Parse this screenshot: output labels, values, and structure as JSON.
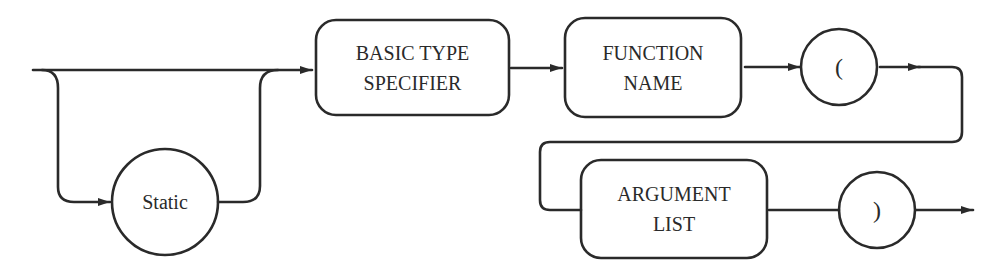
{
  "diagram": {
    "type": "syntax-diagram",
    "nodes": [
      {
        "id": "static",
        "shape": "circle",
        "label": "Static",
        "optional": true
      },
      {
        "id": "basic_type",
        "shape": "rounded-rect",
        "lines": [
          "BASIC TYPE",
          "SPECIFIER"
        ]
      },
      {
        "id": "function_name",
        "shape": "rounded-rect",
        "lines": [
          "FUNCTION",
          "NAME"
        ]
      },
      {
        "id": "open_paren",
        "shape": "circle",
        "label": "("
      },
      {
        "id": "argument_list",
        "shape": "rounded-rect",
        "lines": [
          "ARGUMENT",
          "LIST"
        ]
      },
      {
        "id": "close_paren",
        "shape": "circle",
        "label": ")"
      }
    ],
    "edges": [
      {
        "from": "start",
        "to": "basic_type",
        "note": "bypass Static"
      },
      {
        "from": "start",
        "to": "static"
      },
      {
        "from": "static",
        "to": "basic_type"
      },
      {
        "from": "basic_type",
        "to": "function_name"
      },
      {
        "from": "function_name",
        "to": "open_paren"
      },
      {
        "from": "open_paren",
        "to": "argument_list"
      },
      {
        "from": "argument_list",
        "to": "close_paren"
      },
      {
        "from": "close_paren",
        "to": "end"
      }
    ],
    "stroke_color": "#2a2a2a",
    "background": "#ffffff"
  }
}
